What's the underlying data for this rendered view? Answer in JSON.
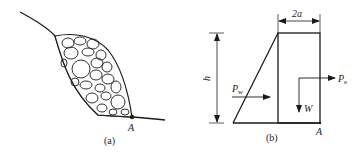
{
  "figure_a": {
    "caption": "(a)",
    "point_label": "A"
  },
  "figure_b": {
    "caption": "(b)",
    "width_label": "2a",
    "height_label": "h",
    "water_force_label": "P",
    "water_force_sub": "w",
    "earthquake_force_label": "P",
    "earthquake_force_sub": "e",
    "weight_label": "W",
    "point_label": "A"
  },
  "colors": {
    "line": "#1a1a1a",
    "background": "#ffffff"
  }
}
